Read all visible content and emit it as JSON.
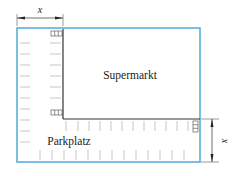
{
  "labels": {
    "building": "Supermarkt",
    "parking": "Parkplatz",
    "dim_top": "x",
    "dim_right": "x"
  },
  "colors": {
    "outer_border": "#5aaedb",
    "building_border": "#333333",
    "ticks": "#b0b0b0",
    "dimension": "#333333"
  },
  "geometry": {
    "outer_rect": {
      "x": 17,
      "y": 28,
      "w": 183,
      "h": 134
    },
    "building_rect": {
      "x": 63,
      "y": 28,
      "w": 137,
      "h": 91
    },
    "dimension_width_label": "x",
    "dimension_height_label": "x"
  }
}
